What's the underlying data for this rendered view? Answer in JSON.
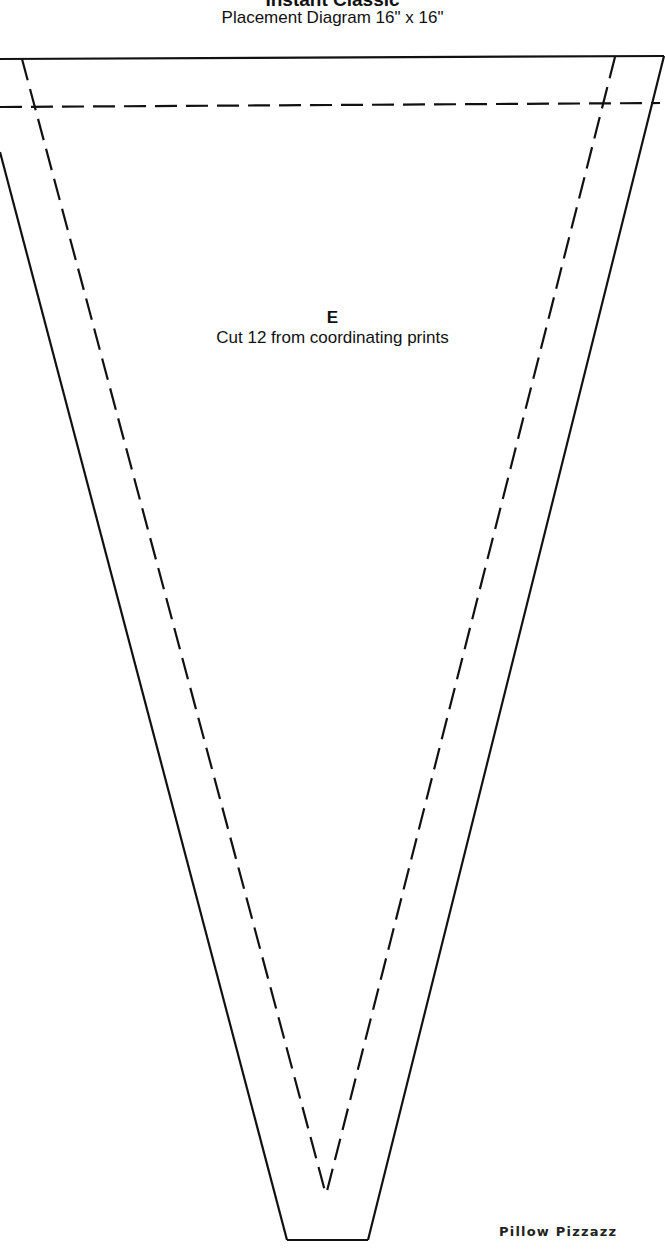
{
  "header": {
    "title": "Instant Classic",
    "subtitle": "Placement Diagram 16\" x 16\""
  },
  "pattern_piece": {
    "letter": "E",
    "instruction": "Cut 12 from coordinating prints",
    "line_color": "#111111"
  },
  "footer": {
    "brand": "Pillow Pizzazz"
  }
}
